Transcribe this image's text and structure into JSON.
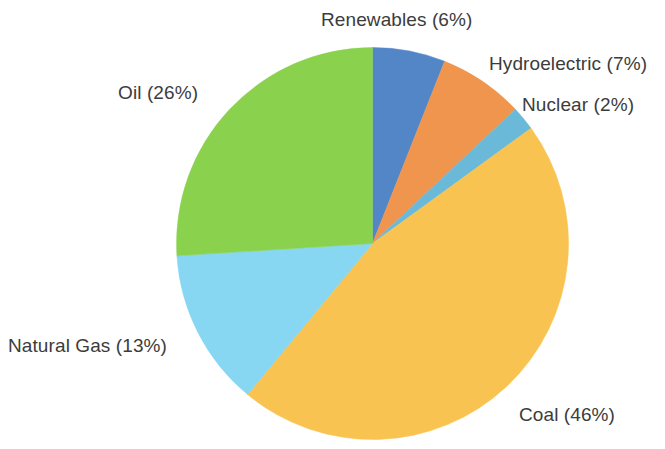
{
  "chart_data": {
    "type": "pie",
    "title": "",
    "subtitle": "",
    "xlabel": "",
    "ylabel": "",
    "legend_position": "none",
    "grid": false,
    "units": "percent",
    "start_angle_deg": 0,
    "direction": "clockwise",
    "categories": [
      "Renewables",
      "Hydroelectric",
      "Nuclear",
      "Coal",
      "Natural Gas",
      "Oil"
    ],
    "values": [
      6,
      7,
      2,
      46,
      13,
      26
    ],
    "colors": [
      "#5386c6",
      "#f0954e",
      "#6bb9d8",
      "#f9c351",
      "#87d6f2",
      "#8ad24e"
    ],
    "labels": [
      "Renewables (6%)",
      "Hydroelectric (7%)",
      "Nuclear (2%)",
      "Coal (46%)",
      "Natural Gas (13%)",
      "Oil (26%)"
    ],
    "slices": [
      {
        "name": "Renewables",
        "value": 6,
        "label": "Renewables (6%)",
        "color": "#5386c6"
      },
      {
        "name": "Hydroelectric",
        "value": 7,
        "label": "Hydroelectric (7%)",
        "color": "#f0954e"
      },
      {
        "name": "Nuclear",
        "value": 2,
        "label": "Nuclear (2%)",
        "color": "#6bb9d8"
      },
      {
        "name": "Coal",
        "value": 46,
        "label": "Coal (46%)",
        "color": "#f9c351"
      },
      {
        "name": "Natural Gas",
        "value": 13,
        "label": "Natural Gas (13%)",
        "color": "#87d6f2"
      },
      {
        "name": "Oil",
        "value": 26,
        "label": "Oil (26%)",
        "color": "#8ad24e"
      }
    ]
  },
  "figure": {
    "background_color": "#ffffff",
    "label_text_color": "#3c3c3c"
  }
}
